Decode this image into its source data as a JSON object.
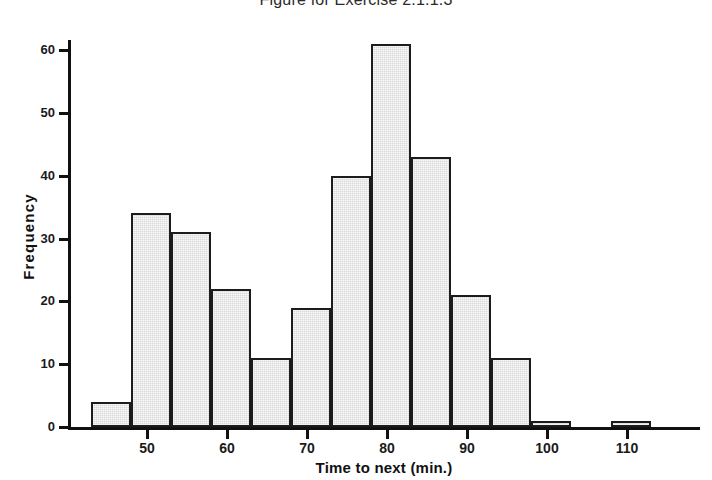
{
  "chart_data": {
    "type": "bar",
    "title": "Figure for Exercise 2.1.1.3",
    "xlabel": "Time to next (min.)",
    "ylabel": "Frequency",
    "xlim": [
      43,
      115
    ],
    "ylim": [
      0,
      63
    ],
    "grid": false,
    "legend": null,
    "bin_width": 5,
    "x_ticks": [
      50,
      60,
      70,
      80,
      90,
      100,
      110
    ],
    "y_ticks": [
      0,
      10,
      20,
      30,
      40,
      50,
      60
    ],
    "bars": [
      {
        "bin_start": 43,
        "bin_end": 48,
        "value": 4
      },
      {
        "bin_start": 48,
        "bin_end": 53,
        "value": 34
      },
      {
        "bin_start": 53,
        "bin_end": 58,
        "value": 31
      },
      {
        "bin_start": 58,
        "bin_end": 63,
        "value": 22
      },
      {
        "bin_start": 63,
        "bin_end": 68,
        "value": 11
      },
      {
        "bin_start": 68,
        "bin_end": 73,
        "value": 19
      },
      {
        "bin_start": 73,
        "bin_end": 78,
        "value": 40
      },
      {
        "bin_start": 78,
        "bin_end": 83,
        "value": 61
      },
      {
        "bin_start": 83,
        "bin_end": 88,
        "value": 43
      },
      {
        "bin_start": 88,
        "bin_end": 93,
        "value": 21
      },
      {
        "bin_start": 93,
        "bin_end": 98,
        "value": 11
      },
      {
        "bin_start": 98,
        "bin_end": 103,
        "value": 1
      },
      {
        "bin_start": 108,
        "bin_end": 113,
        "value": 1
      }
    ],
    "categories": [
      "43-48",
      "48-53",
      "53-58",
      "58-63",
      "63-68",
      "68-73",
      "73-78",
      "78-83",
      "83-88",
      "88-93",
      "93-98",
      "98-103",
      "108-113"
    ],
    "values": [
      4,
      34,
      31,
      22,
      11,
      19,
      40,
      61,
      43,
      21,
      11,
      1,
      1
    ],
    "colors": {
      "bar_fill": "#d9d9d9",
      "bar_border": "#1c1c1c",
      "axis": "#111111",
      "text": "#1a1a1a",
      "background": "#ffffff"
    }
  }
}
